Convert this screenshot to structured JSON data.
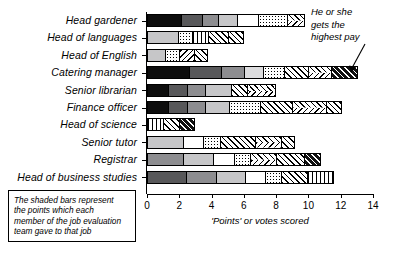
{
  "chart_data": {
    "type": "bar",
    "orientation": "horizontal",
    "stacked": true,
    "title": "",
    "xlabel": "'Points' or votes scored",
    "ylabel": "",
    "xlim": [
      0,
      14
    ],
    "xticks": [
      0,
      2,
      4,
      6,
      8,
      10,
      12,
      14
    ],
    "grid": false,
    "legend": null,
    "categories": [
      "Head gardener",
      "Head of languages",
      "Head of English",
      "Catering manager",
      "Senior librarian",
      "Finance officer",
      "Head of science",
      "Senior tutor",
      "Registrar",
      "Head of business studies"
    ],
    "totals": [
      9.8,
      6.0,
      3.8,
      13.1,
      8.0,
      12.1,
      3.0,
      9.2,
      10.8,
      11.6
    ],
    "bars": [
      {
        "category": "Head gardener",
        "total": 9.8,
        "segments": [
          {
            "value": 2.1,
            "fill": "f-black"
          },
          {
            "value": 1.3,
            "fill": "f-dark"
          },
          {
            "value": 1.0,
            "fill": "f-mid"
          },
          {
            "value": 1.2,
            "fill": "f-light"
          },
          {
            "value": 1.3,
            "fill": "f-white"
          },
          {
            "value": 1.8,
            "fill": "f-dots"
          },
          {
            "value": 1.1,
            "fill": "f-chevron"
          }
        ]
      },
      {
        "category": "Head of languages",
        "total": 6.0,
        "segments": [
          {
            "value": 1.9,
            "fill": "f-light"
          },
          {
            "value": 0.9,
            "fill": "f-dots"
          },
          {
            "value": 1.0,
            "fill": "f-vline"
          },
          {
            "value": 1.2,
            "fill": "f-diag"
          },
          {
            "value": 1.0,
            "fill": "f-cross"
          }
        ]
      },
      {
        "category": "Head of English",
        "total": 3.8,
        "segments": [
          {
            "value": 1.1,
            "fill": "f-light"
          },
          {
            "value": 0.9,
            "fill": "f-dots"
          },
          {
            "value": 0.9,
            "fill": "f-diag2"
          },
          {
            "value": 0.9,
            "fill": "f-cross"
          }
        ]
      },
      {
        "category": "Catering manager",
        "total": 13.1,
        "segments": [
          {
            "value": 2.6,
            "fill": "f-black"
          },
          {
            "value": 2.0,
            "fill": "f-dark"
          },
          {
            "value": 1.4,
            "fill": "f-mid"
          },
          {
            "value": 1.2,
            "fill": "f-lighter"
          },
          {
            "value": 1.3,
            "fill": "f-dots"
          },
          {
            "value": 1.5,
            "fill": "f-diag"
          },
          {
            "value": 1.4,
            "fill": "f-chevron"
          },
          {
            "value": 1.7,
            "fill": "f-dblk"
          }
        ]
      },
      {
        "category": "Senior librarian",
        "total": 8.0,
        "segments": [
          {
            "value": 1.3,
            "fill": "f-black"
          },
          {
            "value": 1.2,
            "fill": "f-dark"
          },
          {
            "value": 1.1,
            "fill": "f-mid"
          },
          {
            "value": 1.6,
            "fill": "f-light"
          },
          {
            "value": 1.0,
            "fill": "f-cross"
          },
          {
            "value": 1.8,
            "fill": "f-chevron"
          }
        ]
      },
      {
        "category": "Finance officer",
        "total": 12.1,
        "segments": [
          {
            "value": 1.3,
            "fill": "f-black"
          },
          {
            "value": 1.2,
            "fill": "f-dark"
          },
          {
            "value": 1.1,
            "fill": "f-mid"
          },
          {
            "value": 1.5,
            "fill": "f-light"
          },
          {
            "value": 1.9,
            "fill": "f-dots"
          },
          {
            "value": 2.0,
            "fill": "f-diag"
          },
          {
            "value": 2.1,
            "fill": "f-chevron"
          },
          {
            "value": 1.0,
            "fill": "f-cross"
          }
        ]
      },
      {
        "category": "Head of science",
        "total": 3.0,
        "segments": [
          {
            "value": 1.0,
            "fill": "f-vline"
          },
          {
            "value": 1.0,
            "fill": "f-diag"
          },
          {
            "value": 1.0,
            "fill": "f-dblk"
          }
        ]
      },
      {
        "category": "Senior tutor",
        "total": 9.2,
        "segments": [
          {
            "value": 2.2,
            "fill": "f-light"
          },
          {
            "value": 1.3,
            "fill": "f-white"
          },
          {
            "value": 1.0,
            "fill": "f-dots"
          },
          {
            "value": 2.2,
            "fill": "f-diag"
          },
          {
            "value": 1.6,
            "fill": "f-chevron"
          },
          {
            "value": 0.9,
            "fill": "f-cross"
          }
        ]
      },
      {
        "category": "Registrar",
        "total": 10.8,
        "segments": [
          {
            "value": 2.2,
            "fill": "f-mid"
          },
          {
            "value": 1.9,
            "fill": "f-light"
          },
          {
            "value": 1.3,
            "fill": "f-white"
          },
          {
            "value": 1.0,
            "fill": "f-dots"
          },
          {
            "value": 1.6,
            "fill": "f-chevron"
          },
          {
            "value": 1.7,
            "fill": "f-diag"
          },
          {
            "value": 1.1,
            "fill": "f-dblk"
          }
        ]
      },
      {
        "category": "Head of business studies",
        "total": 11.6,
        "segments": [
          {
            "value": 2.4,
            "fill": "f-dark"
          },
          {
            "value": 1.9,
            "fill": "f-mid"
          },
          {
            "value": 1.8,
            "fill": "f-light"
          },
          {
            "value": 1.2,
            "fill": "f-white"
          },
          {
            "value": 1.0,
            "fill": "f-dots"
          },
          {
            "value": 1.6,
            "fill": "f-diag"
          },
          {
            "value": 1.7,
            "fill": "f-vline"
          }
        ]
      }
    ],
    "annotations": [
      {
        "text": "He or she gets the highest pay",
        "points_to": "Catering manager"
      }
    ],
    "note": "The shaded bars represent the points which each member of the job evaluation team gave to that job"
  },
  "axis": {
    "tick_labels": [
      "0",
      "2",
      "4",
      "6",
      "8",
      "10",
      "12",
      "14"
    ],
    "title": "'Points' or votes scored"
  },
  "annotation": {
    "line1": "He or she",
    "line2": "gets the",
    "line3": "highest pay"
  },
  "note_box": {
    "line1": "The shaded bars represent",
    "line2": "the points which each",
    "line3": "member of the job evaluation",
    "line4": "team gave to that job"
  }
}
